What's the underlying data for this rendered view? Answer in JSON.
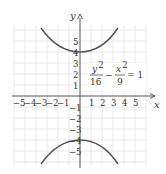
{
  "figure": {
    "type": "hyperbola graph",
    "equation": {
      "lhs_term1_num": "y",
      "lhs_term1_num_exp": "2",
      "lhs_term1_den": "16",
      "minus": "−",
      "lhs_term2_num": "x",
      "lhs_term2_num_exp": "2",
      "lhs_term2_den": "9",
      "equals": "= 1"
    },
    "axes": {
      "x_label": "x",
      "y_label": "y",
      "x_ticks": [
        "−5",
        "−4",
        "−3",
        "−2",
        "−1",
        "1",
        "2",
        "3",
        "4",
        "5"
      ],
      "y_ticks_pos": [
        "1",
        "2",
        "3",
        "4",
        "5"
      ],
      "y_ticks_neg": [
        "−1",
        "−2",
        "−3",
        "−4",
        "−5"
      ]
    },
    "colors": {
      "grid": "#e2e2e2",
      "axis": "#555555",
      "curve": "#555555",
      "text": "#333333"
    }
  }
}
